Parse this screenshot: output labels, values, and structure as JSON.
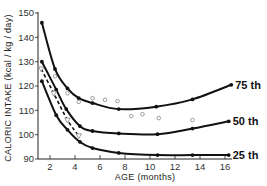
{
  "chart_data": {
    "type": "line",
    "title": "",
    "xlabel": "AGE (months)",
    "ylabel": "CALORIC INTAKE (kcal / kg / day)",
    "xlim": [
      1,
      17
    ],
    "ylim": [
      90,
      150
    ],
    "xticks": [
      2,
      4,
      6,
      8,
      10,
      12,
      14,
      16
    ],
    "yticks": [
      90,
      100,
      110,
      120,
      130,
      140,
      150
    ],
    "grid": false,
    "legend_position": "inline-right",
    "series": [
      {
        "name": "75 th",
        "style": "solid-with-dots",
        "x": [
          1.35,
          2.4,
          3.4,
          4.3,
          5.4,
          7.5,
          10.5,
          13.4,
          16.5
        ],
        "y": [
          146,
          127,
          119,
          115,
          113,
          110.5,
          111.5,
          114.5,
          120.5
        ]
      },
      {
        "name": "50 th",
        "style": "solid-with-dots",
        "x": [
          1.35,
          2.5,
          3.3,
          4.4,
          5.4,
          7.5,
          10.6,
          13.4,
          16.3
        ],
        "y": [
          130,
          118.5,
          110.5,
          103.5,
          101.5,
          100.5,
          100.2,
          102.5,
          105.5
        ]
      },
      {
        "name": "25 th",
        "style": "solid-with-dots",
        "x": [
          1.35,
          2.5,
          3.4,
          4.4,
          5.4,
          7.5,
          10.6,
          13.4,
          16.3
        ],
        "y": [
          122,
          108,
          102,
          97,
          94.5,
          92.5,
          91.6,
          91.6,
          91.6
        ]
      },
      {
        "name": "dashed (triangles)",
        "style": "dashed-with-triangles",
        "x": [
          1.3,
          2.3,
          3.4,
          4.3
        ],
        "y": [
          127,
          117,
          106,
          99.5
        ]
      },
      {
        "name": "open circles",
        "style": "scatter-open-circles",
        "x": [
          2.4,
          3.4,
          4.3,
          5.4,
          6.4,
          7.4,
          8.5,
          9.4,
          10.7,
          13.4
        ],
        "y": [
          124,
          117,
          113.5,
          115,
          114.3,
          113.8,
          107.6,
          108.4,
          106.8,
          106
        ]
      }
    ],
    "annotations": [
      "75 th",
      "50 th",
      "25 th"
    ]
  }
}
